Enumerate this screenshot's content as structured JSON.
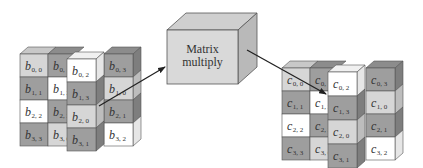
{
  "diagram": {
    "colors": {
      "white": "#ffffff",
      "light": "#d6d6d6",
      "dark": "#9e9e9e",
      "top_light": "#c8c8c8",
      "top_dark": "#8c8c8c",
      "side_dark": "#7e7e7e",
      "side_light": "#bdbdbd",
      "stroke": "#555555",
      "box_front": "#d9d9d9",
      "box_top": "#cfcfcf",
      "box_side": "#b9b9b9",
      "arrow": "#222222"
    },
    "processor": {
      "label_line1": "Matrix",
      "label_line2": "multiply"
    },
    "input_matrix": {
      "name": "B",
      "letter": "b",
      "columns": [
        {
          "cells": [
            {
              "i": "0",
              "j": "0",
              "shade": "light"
            },
            {
              "i": "1",
              "j": "1",
              "shade": "dark"
            },
            {
              "i": "2",
              "j": "2",
              "shade": "white"
            },
            {
              "i": "3",
              "j": "3",
              "shade": "dark"
            }
          ]
        },
        {
          "cells": [
            {
              "i": "0",
              "j": "1",
              "shade": "dark"
            },
            {
              "i": "1",
              "j": "2",
              "shade": "white"
            },
            {
              "i": "2",
              "j": "3",
              "shade": "dark"
            },
            {
              "i": "3",
              "j": "0",
              "shade": "light"
            }
          ]
        },
        {
          "cells": [
            {
              "i": "0",
              "j": "2",
              "shade": "white"
            },
            {
              "i": "1",
              "j": "3",
              "shade": "dark"
            },
            {
              "i": "2",
              "j": "0",
              "shade": "light"
            },
            {
              "i": "3",
              "j": "1",
              "shade": "dark"
            }
          ]
        },
        {
          "cells": [
            {
              "i": "0",
              "j": "3",
              "shade": "dark"
            },
            {
              "i": "1",
              "j": "0",
              "shade": "light"
            },
            {
              "i": "2",
              "j": "1",
              "shade": "dark"
            },
            {
              "i": "3",
              "j": "2",
              "shade": "white"
            }
          ]
        }
      ]
    },
    "output_matrix": {
      "name": "C",
      "letter": "c",
      "columns": [
        {
          "cells": [
            {
              "i": "0",
              "j": "0",
              "shade": "light"
            },
            {
              "i": "1",
              "j": "1",
              "shade": "dark"
            },
            {
              "i": "2",
              "j": "2",
              "shade": "white"
            },
            {
              "i": "3",
              "j": "3",
              "shade": "dark"
            }
          ]
        },
        {
          "cells": [
            {
              "i": "0",
              "j": "1",
              "shade": "dark"
            },
            {
              "i": "1",
              "j": "2",
              "shade": "white"
            },
            {
              "i": "2",
              "j": "3",
              "shade": "dark"
            },
            {
              "i": "3",
              "j": "0",
              "shade": "light"
            }
          ]
        },
        {
          "cells": [
            {
              "i": "0",
              "j": "2",
              "shade": "white"
            },
            {
              "i": "1",
              "j": "3",
              "shade": "dark"
            },
            {
              "i": "2",
              "j": "0",
              "shade": "light"
            },
            {
              "i": "3",
              "j": "1",
              "shade": "dark"
            }
          ]
        },
        {
          "cells": [
            {
              "i": "0",
              "j": "3",
              "shade": "dark"
            },
            {
              "i": "1",
              "j": "0",
              "shade": "light"
            },
            {
              "i": "2",
              "j": "1",
              "shade": "dark"
            },
            {
              "i": "3",
              "j": "2",
              "shade": "white"
            }
          ]
        }
      ]
    },
    "arrows": [
      {
        "from": "input-column-2",
        "to": "matrix-multiply-box"
      },
      {
        "from": "matrix-multiply-box",
        "to": "output-column-1"
      }
    ]
  }
}
